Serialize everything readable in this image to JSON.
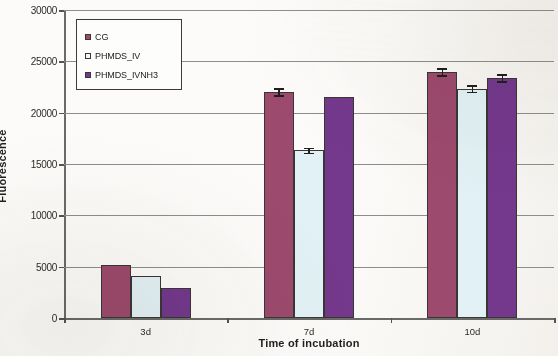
{
  "chart_data": {
    "type": "bar",
    "title": "",
    "xlabel": "Time of incubation",
    "ylabel": "Fluorescence",
    "categories": [
      "3d",
      "7d",
      "10d"
    ],
    "ylim": [
      0,
      30000
    ],
    "yticks": [
      0,
      5000,
      10000,
      15000,
      20000,
      25000,
      30000
    ],
    "ytick_labels": [
      "0",
      "5000",
      "10000",
      "15000",
      "20000",
      "25000",
      "30000"
    ],
    "grid": true,
    "legend_position": "upper left",
    "series": [
      {
        "name": "CG",
        "color": "#9c4a6d",
        "values": [
          5150,
          22050,
          24000
        ],
        "errors": [
          0,
          350,
          350
        ]
      },
      {
        "name": "PHMDS_IV",
        "color": "#e2f1f5",
        "values": [
          4100,
          16350,
          22350
        ],
        "errors": [
          0,
          250,
          300
        ]
      },
      {
        "name": "PHMDS_IVNH3",
        "color": "#74388c",
        "values": [
          2950,
          21500,
          23400
        ],
        "errors": [
          0,
          0,
          350
        ]
      }
    ]
  },
  "legend": {
    "items": [
      {
        "label": "CG",
        "swatch": "legend-swatch-cg"
      },
      {
        "label": "PHMDS_IV",
        "swatch": "legend-swatch-phmds-iv"
      },
      {
        "label": "PHMDS_IVNH3",
        "swatch": "legend-swatch-phmds-ivnh3"
      }
    ]
  }
}
